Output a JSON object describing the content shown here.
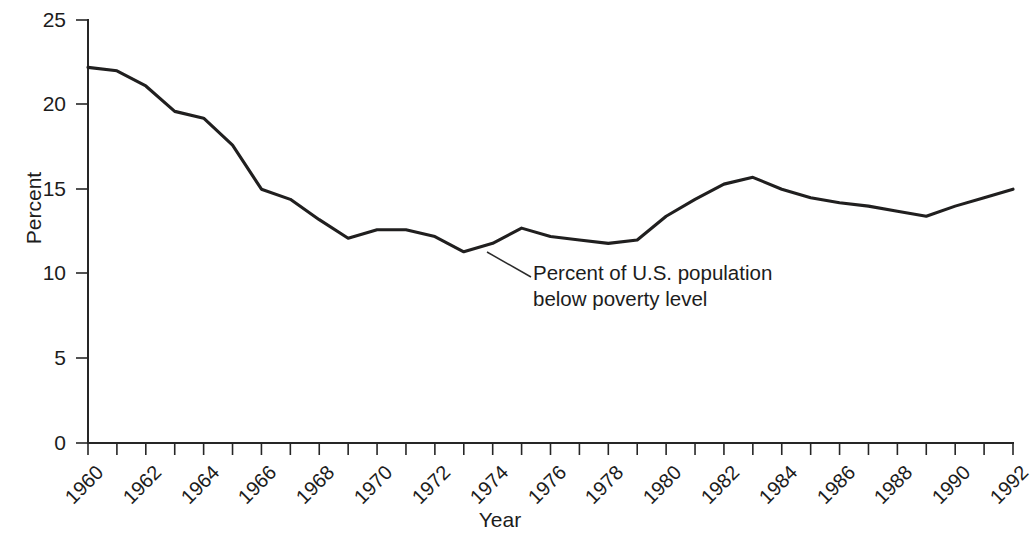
{
  "chart_data": {
    "type": "line",
    "title": "",
    "xlabel": "Year",
    "ylabel": "Percent",
    "xlim": [
      1960,
      1992
    ],
    "ylim": [
      0,
      25
    ],
    "yticks": [
      0,
      5,
      10,
      15,
      20,
      25
    ],
    "ytick_labels": [
      "0",
      "5",
      "10",
      "15",
      "20",
      "25"
    ],
    "xticks": [
      1960,
      1961,
      1962,
      1963,
      1964,
      1965,
      1966,
      1967,
      1968,
      1969,
      1970,
      1971,
      1972,
      1973,
      1974,
      1975,
      1976,
      1977,
      1978,
      1979,
      1980,
      1981,
      1982,
      1983,
      1984,
      1985,
      1986,
      1987,
      1988,
      1989,
      1990,
      1991,
      1992
    ],
    "xtick_labels": [
      "1960",
      "",
      "1962",
      "",
      "1964",
      "",
      "1966",
      "",
      "1968",
      "",
      "1970",
      "",
      "1972",
      "",
      "1974",
      "",
      "1976",
      "",
      "1978",
      "",
      "1980",
      "",
      "1982",
      "",
      "1984",
      "",
      "1986",
      "",
      "1988",
      "",
      "1990",
      "",
      "1992"
    ],
    "grid": false,
    "legend": null,
    "annotations": [
      {
        "text_line_1": "Percent of U.S. population",
        "text_line_2": "below poverty level",
        "points_to_year": 1974,
        "points_to_value": 11.8
      }
    ],
    "series": [
      {
        "name": "Percent of U.S. population below poverty level",
        "color": "#201f1f",
        "x": [
          1960,
          1961,
          1962,
          1963,
          1964,
          1965,
          1966,
          1967,
          1968,
          1969,
          1970,
          1971,
          1972,
          1973,
          1974,
          1975,
          1976,
          1977,
          1978,
          1979,
          1980,
          1981,
          1982,
          1983,
          1984,
          1985,
          1986,
          1987,
          1988,
          1989,
          1990,
          1991,
          1992
        ],
        "values": [
          22.2,
          22.0,
          21.1,
          19.6,
          19.2,
          17.6,
          15.0,
          14.4,
          13.2,
          12.1,
          12.6,
          12.6,
          12.2,
          11.3,
          11.8,
          12.7,
          12.2,
          12.0,
          11.8,
          12.0,
          13.4,
          14.4,
          15.3,
          15.7,
          15.0,
          14.5,
          14.2,
          14.0,
          13.7,
          13.4,
          14.0,
          14.5,
          15.0
        ]
      }
    ]
  },
  "figure": {
    "background_color": "#ffffff",
    "line_color": "#201f1f",
    "axis_color": "#262626"
  }
}
